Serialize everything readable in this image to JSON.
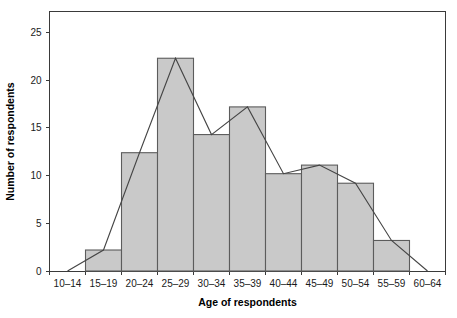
{
  "chart_data": {
    "type": "bar",
    "title": "",
    "subtitle": "",
    "xlabel": "Age of respondents",
    "ylabel": "Number of respondents",
    "categories": [
      "10–14",
      "15–19",
      "20–24",
      "25–29",
      "30–34",
      "35–39",
      "40–44",
      "45–49",
      "50–54",
      "55–59",
      "60–64"
    ],
    "values": [
      0,
      2.2,
      12.4,
      22.3,
      14.3,
      17.2,
      10.2,
      11.1,
      9.2,
      3.2,
      0
    ],
    "series": [
      {
        "name": "Histogram bars",
        "type": "bar",
        "values": [
          0,
          2.2,
          12.4,
          22.3,
          14.3,
          17.2,
          10.2,
          11.1,
          9.2,
          3.2,
          0
        ]
      },
      {
        "name": "Frequency polygon",
        "type": "line",
        "values": [
          0,
          2.2,
          12.4,
          22.3,
          14.3,
          17.2,
          10.2,
          11.1,
          9.2,
          3.2,
          0
        ]
      }
    ],
    "xtick_labels": [
      "10–14",
      "15–19",
      "20–24",
      "25–29",
      "30–34",
      "35–39",
      "40–44",
      "45–49",
      "50–54",
      "55–59",
      "60–64"
    ],
    "ytick_labels": [
      "0",
      "5",
      "10",
      "15",
      "20",
      "25"
    ],
    "ytick_values": [
      0,
      5,
      10,
      15,
      20,
      25
    ],
    "ylim": [
      0,
      27.2
    ],
    "grid": false,
    "legend": "none",
    "colors": {
      "bar_fill": "#c9c9c9",
      "bar_stroke": "#5c5c5c",
      "line": "#454545",
      "axis": "#3a3a3a",
      "text": "#1a1a1a",
      "background": "#ffffff"
    }
  }
}
